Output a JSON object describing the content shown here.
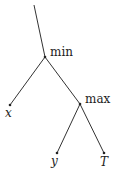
{
  "diagram": {
    "type": "tree",
    "nodes": {
      "min": {
        "label": "min"
      },
      "max": {
        "label": "max"
      },
      "x": {
        "label": "x"
      },
      "y": {
        "label": "y"
      },
      "T": {
        "label": "T"
      }
    },
    "edges": [
      [
        "root",
        "min"
      ],
      [
        "min",
        "x"
      ],
      [
        "min",
        "max"
      ],
      [
        "max",
        "y"
      ],
      [
        "max",
        "T"
      ]
    ],
    "colors": {
      "line": "#333333",
      "text": "#222222"
    }
  }
}
